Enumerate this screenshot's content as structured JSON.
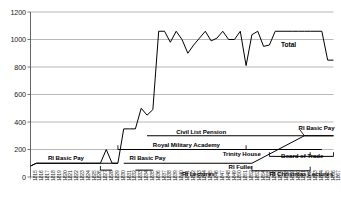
{
  "chart_data": {
    "type": "line",
    "title": "",
    "xlabel": "",
    "ylabel": "",
    "ylim": [
      0,
      1200
    ],
    "ytick_step": 200,
    "yticks": [
      "0",
      "200",
      "400",
      "600",
      "800",
      "1000",
      "1200"
    ],
    "grid": true,
    "grid_axis": "y",
    "legend_position": "inline-annotations",
    "x_start": 1815,
    "x_end": 1867,
    "xticks": [
      "1815",
      "1816",
      "1817",
      "1818",
      "1819",
      "1820",
      "1821",
      "1822",
      "1823",
      "1824",
      "1825",
      "1826",
      "1827",
      "1828",
      "1829",
      "1830",
      "1831",
      "1832",
      "1833",
      "1834",
      "1835",
      "1836",
      "1837",
      "1838",
      "1839",
      "1840",
      "1841",
      "1842",
      "1843",
      "1844",
      "1845",
      "1846",
      "1847",
      "1848",
      "1849",
      "1850",
      "1851",
      "1852",
      "1853",
      "1854",
      "1855",
      "1856",
      "1857",
      "1858",
      "1859",
      "1860",
      "1861",
      "1862",
      "1863",
      "1864",
      "1865",
      "1866",
      "1867"
    ],
    "series": [
      {
        "name": "Total",
        "x": [
          1815,
          1816,
          1817,
          1818,
          1819,
          1820,
          1821,
          1822,
          1823,
          1824,
          1825,
          1826,
          1827,
          1828,
          1829,
          1830,
          1831,
          1832,
          1833,
          1834,
          1835,
          1836,
          1837,
          1838,
          1839,
          1840,
          1841,
          1842,
          1843,
          1844,
          1845,
          1846,
          1847,
          1848,
          1849,
          1850,
          1851,
          1852,
          1853,
          1854,
          1855,
          1856,
          1857,
          1858,
          1859,
          1860,
          1861,
          1862,
          1863,
          1864,
          1865,
          1866,
          1867
        ],
        "values": [
          80,
          100,
          100,
          100,
          100,
          100,
          100,
          100,
          100,
          100,
          100,
          100,
          100,
          200,
          100,
          100,
          350,
          350,
          350,
          500,
          450,
          490,
          1060,
          1060,
          980,
          1060,
          1000,
          900,
          960,
          1010,
          1060,
          990,
          1010,
          1060,
          1000,
          1000,
          1060,
          810,
          1035,
          1060,
          950,
          960,
          1060,
          1060,
          1060,
          1060,
          1060,
          1060,
          1060,
          1060,
          1060,
          850,
          850
        ]
      },
      {
        "name": "RI Basic Pay (early)",
        "x": [
          1815,
          1816,
          1829,
          1830
        ],
        "values": [
          80,
          100,
          100,
          100
        ]
      },
      {
        "name": "RI Basic Pay (later)",
        "x": [
          1831,
          1853,
          1862,
          1867
        ],
        "values": [
          100,
          100,
          300,
          300
        ]
      },
      {
        "name": "Civil List Pension",
        "x": [
          1835,
          1867
        ],
        "values": [
          300,
          300
        ]
      },
      {
        "name": "Royal Military Academy",
        "x": [
          1830,
          1852
        ],
        "values": [
          200,
          200
        ]
      },
      {
        "name": "Trinity House",
        "x": [
          1836,
          1865
        ],
        "values": [
          200,
          200
        ]
      },
      {
        "name": "Board of Trade",
        "x": [
          1856,
          1867
        ],
        "values": [
          150,
          150
        ]
      },
      {
        "name": "RI Lectures",
        "x": [
          1827,
          1829
        ],
        "values": [
          50,
          50
        ]
      },
      {
        "name": "RI Fuller",
        "x": [
          1833,
          1836
        ],
        "values": [
          50,
          50
        ]
      },
      {
        "name": "RI Christmas Lectures",
        "x": [
          1853,
          1863
        ],
        "values": [
          45,
          45
        ]
      }
    ],
    "annotations": [
      {
        "label": "Total",
        "x": 1858,
        "y": 960
      },
      {
        "label": "RI Basic Pay",
        "x": 1818,
        "y": 140
      },
      {
        "label": "RI Basic Pay",
        "x": 1832,
        "y": 140
      },
      {
        "label": "RI Basic Pay",
        "x": 1861,
        "y": 360
      },
      {
        "label": "Civil List Pension",
        "x": 1840,
        "y": 330
      },
      {
        "label": "Royal Military Academy",
        "x": 1836,
        "y": 230
      },
      {
        "label": "Trinity House",
        "x": 1848,
        "y": 165
      },
      {
        "label": "Board of Trade",
        "x": 1858,
        "y": 150
      },
      {
        "label": "RI Lectures",
        "x": 1841,
        "y": 25
      },
      {
        "label": "RI Fuller",
        "x": 1849,
        "y": 70
      },
      {
        "label": "RI Christmas Lectures",
        "x": 1856,
        "y": 25
      }
    ]
  },
  "axis": {
    "y_labels": [
      "1200",
      "1000",
      "800",
      "600",
      "400",
      "200",
      "0"
    ],
    "x_labels": [
      "1815",
      "1816",
      "1817",
      "1818",
      "1819",
      "1820",
      "1821",
      "1822",
      "1823",
      "1824",
      "1825",
      "1826",
      "1827",
      "1828",
      "1829",
      "1830",
      "1831",
      "1832",
      "1833",
      "1834",
      "1835",
      "1836",
      "1837",
      "1838",
      "1839",
      "1840",
      "1841",
      "1842",
      "1843",
      "1844",
      "1845",
      "1846",
      "1847",
      "1848",
      "1849",
      "1850",
      "1851",
      "1852",
      "1853",
      "1854",
      "1855",
      "1856",
      "1857",
      "1858",
      "1859",
      "1860",
      "1861",
      "1862",
      "1863",
      "1864",
      "1865",
      "1866",
      "1867"
    ]
  },
  "labels": {
    "total": "Total",
    "ri_basic_pay": "RI Basic Pay",
    "civil_list_pension": "Civil List Pension",
    "royal_military_academy": "Royal Military Academy",
    "trinity_house": "Trinity House",
    "board_of_trade": "Board of Trade",
    "ri_lectures": "RI Lectures",
    "ri_fuller": "RI Fuller",
    "ri_christmas_lectures": "RI Christmas Lectures"
  },
  "colors": {
    "line": "#000000",
    "grid": "#9a9a9a",
    "axis": "#555555",
    "text": "#1a1a1a",
    "background": "#ffffff"
  }
}
